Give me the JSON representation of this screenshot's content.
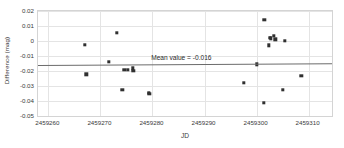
{
  "chart_data": {
    "type": "scatter",
    "title": "",
    "xlabel": "JD",
    "ylabel": "Difference (mag)",
    "xlim": [
      2459258.0,
      2459314.5
    ],
    "ylim": [
      -0.05,
      0.02
    ],
    "xticks": [
      2459260,
      2459270,
      2459280,
      2459290,
      2459300,
      2459310
    ],
    "xtick_labels": [
      "2459260",
      "2459270",
      "2459280",
      "2459290",
      "2459300",
      "2459310"
    ],
    "yticks": [
      0.02,
      0.01,
      0,
      -0.01,
      -0.02,
      -0.03,
      -0.04,
      -0.05
    ],
    "ytick_labels": [
      "0.02",
      "0.01",
      "0",
      "-0.01",
      "-0.02",
      "-0.03",
      "-0.04",
      "-0.05"
    ],
    "grid": true,
    "legend": "none",
    "marker": "square",
    "marker_color": "#303030",
    "series": [
      {
        "name": "Difference",
        "points": [
          {
            "x": 2459267.0,
            "y": -0.0025
          },
          {
            "x": 2459267.3,
            "y": -0.0222
          },
          {
            "x": 2459271.6,
            "y": -0.0139
          },
          {
            "x": 2459273.2,
            "y": 0.0055
          },
          {
            "x": 2459274.2,
            "y": -0.0327
          },
          {
            "x": 2459274.6,
            "y": -0.0194
          },
          {
            "x": 2459275.3,
            "y": -0.0191
          },
          {
            "x": 2459276.2,
            "y": -0.0183
          },
          {
            "x": 2459276.3,
            "y": -0.0199
          },
          {
            "x": 2459279.3,
            "y": -0.0344
          },
          {
            "x": 2459279.4,
            "y": -0.035
          },
          {
            "x": 2459297.5,
            "y": -0.0277
          },
          {
            "x": 2459300.0,
            "y": -0.0155
          },
          {
            "x": 2459301.4,
            "y": -0.041
          },
          {
            "x": 2459301.5,
            "y": 0.0143
          },
          {
            "x": 2459302.3,
            "y": -0.0028
          },
          {
            "x": 2459302.6,
            "y": 0.0023
          },
          {
            "x": 2459302.7,
            "y": 0.0017
          },
          {
            "x": 2459303.3,
            "y": 0.0035
          },
          {
            "x": 2459303.6,
            "y": 0.0012
          },
          {
            "x": 2459305.0,
            "y": -0.0327
          },
          {
            "x": 2459305.4,
            "y": 0.0
          },
          {
            "x": 2459308.6,
            "y": -0.0233
          }
        ]
      }
    ],
    "mean_line": {
      "label": "Mean value = -0.016",
      "value": -0.016,
      "y_left": -0.0158,
      "y_right": -0.0146,
      "color": "#6b6b6b"
    }
  }
}
